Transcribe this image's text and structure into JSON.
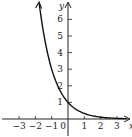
{
  "chart_data": {
    "type": "line",
    "title": "",
    "xlabel": "x",
    "ylabel": "y",
    "xlim": [
      -3.9,
      3.9
    ],
    "ylim": [
      -0.9,
      7.1
    ],
    "x_ticks": [
      -3,
      -2,
      -1,
      1,
      2,
      3
    ],
    "x_tick_labels": [
      "−3",
      "−2",
      "−1",
      "1",
      "2",
      "3"
    ],
    "y_ticks": [
      1,
      2,
      3,
      4,
      5,
      6
    ],
    "y_tick_labels": [
      "1",
      "2",
      "3",
      "4",
      "5",
      "6"
    ],
    "origin_label": "0",
    "grid": false,
    "series": [
      {
        "name": "y = (1/3)^x",
        "function": "3^(-x)",
        "x": [
          -1.77,
          -1.5,
          -1,
          -0.5,
          0,
          0.5,
          1,
          1.5,
          2,
          2.5,
          3,
          3.6
        ],
        "y": [
          7.0,
          5.2,
          3.0,
          1.73,
          1.0,
          0.58,
          0.33,
          0.19,
          0.11,
          0.06,
          0.04,
          0.02
        ]
      }
    ],
    "colors": {
      "axis": "#222222",
      "curve": "#111111"
    }
  }
}
